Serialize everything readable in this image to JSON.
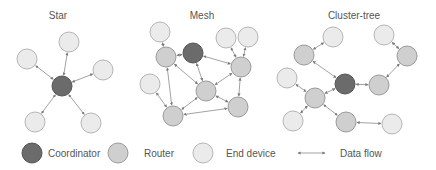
{
  "colors": {
    "coordinator_fill": "#6b6b6b",
    "coordinator_stroke": "#555555",
    "router_fill": "#cfcfcf",
    "router_stroke": "#9a9a9a",
    "end_fill": "#ebebeb",
    "end_stroke": "#b5b5b5",
    "edge": "#8a8a8a",
    "text": "#555555"
  },
  "topologies": [
    {
      "id": "star",
      "title": "Star",
      "title_pos": [
        58,
        19
      ],
      "nodes": [
        {
          "id": "c",
          "type": "coordinator",
          "x": 62,
          "y": 86
        },
        {
          "id": "e1",
          "type": "end",
          "x": 69,
          "y": 42
        },
        {
          "id": "e2",
          "type": "end",
          "x": 27,
          "y": 59
        },
        {
          "id": "e3",
          "type": "end",
          "x": 103,
          "y": 70
        },
        {
          "id": "e4",
          "type": "end",
          "x": 35,
          "y": 122
        },
        {
          "id": "e5",
          "type": "end",
          "x": 91,
          "y": 123
        }
      ],
      "edges": [
        [
          "c",
          "e1"
        ],
        [
          "c",
          "e2"
        ],
        [
          "c",
          "e3"
        ],
        [
          "c",
          "e4"
        ],
        [
          "c",
          "e5"
        ]
      ]
    },
    {
      "id": "mesh",
      "title": "Mesh",
      "title_pos": [
        202,
        19
      ],
      "nodes": [
        {
          "id": "c",
          "type": "coordinator",
          "x": 193,
          "y": 53
        },
        {
          "id": "eTL",
          "type": "end",
          "x": 160,
          "y": 32
        },
        {
          "id": "eT1",
          "type": "end",
          "x": 226,
          "y": 38
        },
        {
          "id": "eT2",
          "type": "end",
          "x": 248,
          "y": 37
        },
        {
          "id": "eL",
          "type": "end",
          "x": 150,
          "y": 84
        },
        {
          "id": "rL",
          "type": "router",
          "x": 166,
          "y": 57
        },
        {
          "id": "rR",
          "type": "router",
          "x": 241,
          "y": 67
        },
        {
          "id": "rC",
          "type": "router",
          "x": 206,
          "y": 91
        },
        {
          "id": "rLR",
          "type": "router",
          "x": 238,
          "y": 107
        },
        {
          "id": "rBL",
          "type": "router",
          "x": 173,
          "y": 116
        }
      ],
      "edges": [
        [
          "eTL",
          "rL"
        ],
        [
          "rL",
          "c"
        ],
        [
          "c",
          "rR"
        ],
        [
          "c",
          "rC"
        ],
        [
          "eT1",
          "rR"
        ],
        [
          "eT2",
          "rR"
        ],
        [
          "rR",
          "rC"
        ],
        [
          "rR",
          "rLR"
        ],
        [
          "rL",
          "rC"
        ],
        [
          "rL",
          "rBL"
        ],
        [
          "rC",
          "rLR"
        ],
        [
          "rC",
          "rBL"
        ],
        [
          "eL",
          "rBL"
        ],
        [
          "rBL",
          "rLR"
        ]
      ]
    },
    {
      "id": "cluster_tree",
      "title": "Cluster-tree",
      "title_pos": [
        354,
        19
      ],
      "nodes": [
        {
          "id": "c",
          "type": "coordinator",
          "x": 345,
          "y": 84
        },
        {
          "id": "eT",
          "type": "end",
          "x": 333,
          "y": 37
        },
        {
          "id": "rTL",
          "type": "router",
          "x": 304,
          "y": 55
        },
        {
          "id": "eTR",
          "type": "end",
          "x": 384,
          "y": 35
        },
        {
          "id": "rRT",
          "type": "router",
          "x": 407,
          "y": 56
        },
        {
          "id": "rRM",
          "type": "router",
          "x": 379,
          "y": 85
        },
        {
          "id": "eL",
          "type": "end",
          "x": 287,
          "y": 78
        },
        {
          "id": "rLM",
          "type": "router",
          "x": 315,
          "y": 98
        },
        {
          "id": "eBL",
          "type": "end",
          "x": 293,
          "y": 121
        },
        {
          "id": "rB",
          "type": "router",
          "x": 346,
          "y": 122
        },
        {
          "id": "eBR",
          "type": "end",
          "x": 392,
          "y": 124
        }
      ],
      "edges": [
        [
          "eT",
          "rTL"
        ],
        [
          "rTL",
          "c"
        ],
        [
          "eTR",
          "rRT"
        ],
        [
          "rRT",
          "rRM"
        ],
        [
          "rRM",
          "c"
        ],
        [
          "c",
          "rLM"
        ],
        [
          "eL",
          "rLM"
        ],
        [
          "rLM",
          "eBL"
        ],
        [
          "rLM",
          "rB"
        ],
        [
          "rB",
          "eBR"
        ]
      ]
    }
  ],
  "node_radius": 10,
  "legend": {
    "items": [
      {
        "type": "coordinator",
        "label": "Coordinator",
        "x": 32,
        "y": 153,
        "text_x": 48
      },
      {
        "type": "router",
        "label": "Router",
        "x": 118,
        "y": 153,
        "text_x": 144
      },
      {
        "type": "end",
        "label": "End device",
        "x": 203,
        "y": 153,
        "text_x": 226
      },
      {
        "type": "flow",
        "label": "Data flow",
        "x1": 298,
        "x2": 325,
        "y": 153,
        "text_x": 340
      }
    ]
  }
}
